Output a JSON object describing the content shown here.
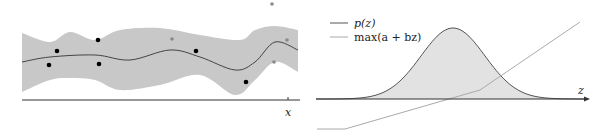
{
  "chart_data": [
    {
      "type": "line",
      "title": "",
      "xlabel": "x",
      "ylabel": "",
      "grid": false,
      "description": "Gaussian process posterior: mean curve with shaded confidence band and observed points",
      "mean_curve": [
        [
          22,
          62
        ],
        [
          50,
          57
        ],
        [
          95,
          55
        ],
        [
          130,
          60
        ],
        [
          170,
          50
        ],
        [
          200,
          57
        ],
        [
          235,
          70
        ],
        [
          255,
          62
        ],
        [
          275,
          42
        ],
        [
          298,
          50
        ]
      ],
      "band_upper": [
        [
          22,
          33
        ],
        [
          50,
          42
        ],
        [
          70,
          32
        ],
        [
          95,
          40
        ],
        [
          120,
          30
        ],
        [
          160,
          28
        ],
        [
          200,
          35
        ],
        [
          240,
          40
        ],
        [
          255,
          30
        ],
        [
          275,
          26
        ],
        [
          298,
          30
        ]
      ],
      "band_lower": [
        [
          22,
          92
        ],
        [
          50,
          80
        ],
        [
          70,
          78
        ],
        [
          95,
          80
        ],
        [
          120,
          90
        ],
        [
          160,
          85
        ],
        [
          200,
          75
        ],
        [
          235,
          95
        ],
        [
          255,
          80
        ],
        [
          275,
          62
        ],
        [
          298,
          72
        ]
      ],
      "observed_points": [
        [
          57,
          51
        ],
        [
          49,
          65
        ],
        [
          98,
          40
        ],
        [
          99,
          64
        ],
        [
          196,
          51
        ],
        [
          246,
          82
        ]
      ],
      "candidate_points": [
        [
          172,
          39
        ],
        [
          272,
          4
        ],
        [
          287,
          40
        ],
        [
          274,
          62
        ]
      ],
      "colors": {
        "band": "#c8c8c8",
        "mean": "#444444",
        "observed": "#000000",
        "candidate": "#8a8a8a",
        "axis": "#333333"
      }
    },
    {
      "type": "area",
      "title": "",
      "xlabel": "z",
      "ylabel": "",
      "grid": false,
      "legend": [
        {
          "label": "p(z)",
          "color": "#555555"
        },
        {
          "label": "max(a + bz)",
          "color": "#aaaaaa"
        }
      ],
      "legend_position": "upper-left",
      "gaussian": {
        "center_x": 453,
        "peak_y": 28,
        "baseline_y": 99,
        "sigma_px": 32
      },
      "hinge_line": [
        [
          317,
          129
        ],
        [
          345,
          129
        ],
        [
          480,
          90
        ],
        [
          580,
          22
        ]
      ],
      "colors": {
        "fill": "#e2e2e2",
        "curve": "#555555",
        "hinge": "#aaaaaa",
        "axis": "#333333"
      }
    }
  ],
  "labels": {
    "left_axis": "x",
    "right_axis": "z",
    "legend_p": "p(z)",
    "legend_max": "max(a + bz)"
  }
}
